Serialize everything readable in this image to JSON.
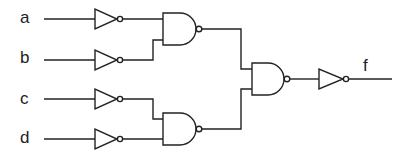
{
  "diagram": {
    "type": "logic-circuit",
    "inputs": [
      {
        "id": "a",
        "label": "a"
      },
      {
        "id": "b",
        "label": "b"
      },
      {
        "id": "c",
        "label": "c"
      },
      {
        "id": "d",
        "label": "d"
      }
    ],
    "output": {
      "id": "f",
      "label": "f"
    },
    "gates": [
      {
        "id": "not_a",
        "type": "NOT",
        "input": "a"
      },
      {
        "id": "not_b",
        "type": "NOT",
        "input": "b"
      },
      {
        "id": "not_c",
        "type": "NOT",
        "input": "c"
      },
      {
        "id": "not_d",
        "type": "NOT",
        "input": "d"
      },
      {
        "id": "nand1",
        "type": "NAND",
        "inputs": [
          "not_a",
          "not_b"
        ]
      },
      {
        "id": "nand2",
        "type": "NAND",
        "inputs": [
          "not_c",
          "not_d"
        ]
      },
      {
        "id": "nand3",
        "type": "NAND",
        "inputs": [
          "nand1",
          "nand2"
        ]
      },
      {
        "id": "not_out",
        "type": "NOT",
        "input": "nand3",
        "output": "f"
      }
    ],
    "colors": {
      "stroke": "#222222",
      "background": "#ffffff"
    }
  }
}
